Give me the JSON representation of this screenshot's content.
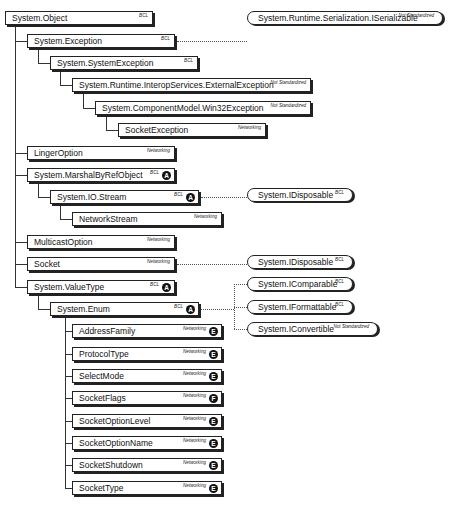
{
  "diagram": {
    "classes": [
      {
        "id": "object",
        "name": "System.Object",
        "tag": "BCL",
        "badge": null,
        "x": 5,
        "y": 11,
        "w": 148
      },
      {
        "id": "exception",
        "name": "System.Exception",
        "tag": "BCL",
        "badge": null,
        "x": 27,
        "y": 34,
        "w": 148
      },
      {
        "id": "system-exception",
        "name": "System.SystemException",
        "tag": "BCL",
        "badge": null,
        "x": 50,
        "y": 56,
        "w": 148
      },
      {
        "id": "external-exception",
        "name": "System.Runtime.InteropServices.ExternalException",
        "tag": "Not Standardized",
        "badge": null,
        "x": 72,
        "y": 78,
        "w": 239
      },
      {
        "id": "win32-exception",
        "name": "System.ComponentModel.Win32Exception",
        "tag": "Not Standardized",
        "badge": null,
        "x": 95,
        "y": 101,
        "w": 216
      },
      {
        "id": "socket-exception",
        "name": "SocketException",
        "tag": "Networking",
        "badge": null,
        "x": 118,
        "y": 123,
        "w": 148
      },
      {
        "id": "linger-option",
        "name": "LingerOption",
        "tag": "Networking",
        "badge": null,
        "x": 27,
        "y": 146,
        "w": 148
      },
      {
        "id": "marshal-by-ref-object",
        "name": "System.MarshalByRefObject",
        "tag": "BCL",
        "badge": "A",
        "x": 27,
        "y": 168,
        "w": 148
      },
      {
        "id": "io-stream",
        "name": "System.IO.Stream",
        "tag": "BCL",
        "badge": "A",
        "x": 50,
        "y": 190,
        "w": 149
      },
      {
        "id": "network-stream",
        "name": "NetworkStream",
        "tag": "Networking",
        "badge": null,
        "x": 72,
        "y": 212,
        "w": 150
      },
      {
        "id": "multicast-option",
        "name": "MulticastOption",
        "tag": "Networking",
        "badge": null,
        "x": 27,
        "y": 235,
        "w": 148
      },
      {
        "id": "socket",
        "name": "Socket",
        "tag": "Networking",
        "badge": null,
        "x": 27,
        "y": 257,
        "w": 148
      },
      {
        "id": "value-type",
        "name": "System.ValueType",
        "tag": "BCL",
        "badge": "A",
        "x": 27,
        "y": 280,
        "w": 148
      },
      {
        "id": "enum",
        "name": "System.Enum",
        "tag": "BCL",
        "badge": "A",
        "x": 50,
        "y": 302,
        "w": 149
      },
      {
        "id": "address-family",
        "name": "AddressFamily",
        "tag": "Networking",
        "badge": "E",
        "x": 72,
        "y": 324,
        "w": 150
      },
      {
        "id": "protocol-type",
        "name": "ProtocolType",
        "tag": "Networking",
        "badge": "E",
        "x": 72,
        "y": 347,
        "w": 150
      },
      {
        "id": "select-mode",
        "name": "SelectMode",
        "tag": "Networking",
        "badge": "E",
        "x": 72,
        "y": 369,
        "w": 150
      },
      {
        "id": "socket-flags",
        "name": "SocketFlags",
        "tag": "Networking",
        "badge": "F",
        "x": 72,
        "y": 391,
        "w": 150
      },
      {
        "id": "socket-option-level",
        "name": "SocketOptionLevel",
        "tag": "Networking",
        "badge": "E",
        "x": 72,
        "y": 414,
        "w": 150
      },
      {
        "id": "socket-option-name",
        "name": "SocketOptionName",
        "tag": "Networking",
        "badge": "E",
        "x": 72,
        "y": 436,
        "w": 150
      },
      {
        "id": "socket-shutdown",
        "name": "SocketShutdown",
        "tag": "Networking",
        "badge": "E",
        "x": 72,
        "y": 458,
        "w": 150
      },
      {
        "id": "socket-type",
        "name": "SocketType",
        "tag": "Networking",
        "badge": "E",
        "x": 72,
        "y": 481,
        "w": 150
      }
    ],
    "interfaces": [
      {
        "id": "iserializable",
        "name": "System.Runtime.Serialization.ISerializable",
        "tag": "Not Standardized",
        "x": 247,
        "y": 11,
        "w": 196
      },
      {
        "id": "idisposable-stream",
        "name": "System.IDisposable",
        "tag": "BCL",
        "x": 247,
        "y": 188,
        "w": 106
      },
      {
        "id": "idisposable-socket",
        "name": "System.IDisposable",
        "tag": "BCL",
        "x": 247,
        "y": 255,
        "w": 106
      },
      {
        "id": "icomparable",
        "name": "System.IComparable",
        "tag": "BCL",
        "x": 247,
        "y": 277,
        "w": 106
      },
      {
        "id": "iformattable",
        "name": "System.IFormattable",
        "tag": "BCL",
        "x": 247,
        "y": 300,
        "w": 106
      },
      {
        "id": "iconvertible",
        "name": "System.IConvertible",
        "tag": "Not Standardized",
        "x": 247,
        "y": 322,
        "w": 131
      }
    ],
    "inheritance_lines": [
      {
        "x": 15,
        "y1": 25,
        "y2": 287,
        "children_y": [
          41,
          153,
          175,
          242,
          264,
          287
        ]
      },
      {
        "x": 38,
        "y1": 48,
        "y2": 63,
        "children_y": [
          63
        ]
      },
      {
        "x": 60,
        "y1": 70,
        "y2": 85,
        "children_y": [
          85
        ]
      },
      {
        "x": 83,
        "y1": 92,
        "y2": 108,
        "children_y": [
          108
        ]
      },
      {
        "x": 106,
        "y1": 115,
        "y2": 130,
        "children_y": [
          130
        ]
      },
      {
        "x": 38,
        "y1": 182,
        "y2": 197,
        "children_y": [
          197
        ]
      },
      {
        "x": 60,
        "y1": 204,
        "y2": 219,
        "children_y": [
          219
        ]
      },
      {
        "x": 38,
        "y1": 294,
        "y2": 309,
        "children_y": [
          309
        ]
      },
      {
        "x": 65,
        "y1": 316,
        "y2": 488,
        "children_y": [
          331,
          354,
          376,
          398,
          421,
          443,
          465,
          488
        ]
      }
    ],
    "implements_links": [
      {
        "from_x": 177,
        "y": 41,
        "to_x": 247
      },
      {
        "from_x": 201,
        "y": 197,
        "to_x": 247
      },
      {
        "from_x": 177,
        "y": 264,
        "to_x": 247
      },
      {
        "from_x": 201,
        "y": 309,
        "to_x": 234
      },
      {
        "v_x": 234,
        "y1": 284,
        "y2": 329,
        "branch_y": [
          284,
          307,
          329
        ],
        "to_x": 247
      }
    ]
  }
}
